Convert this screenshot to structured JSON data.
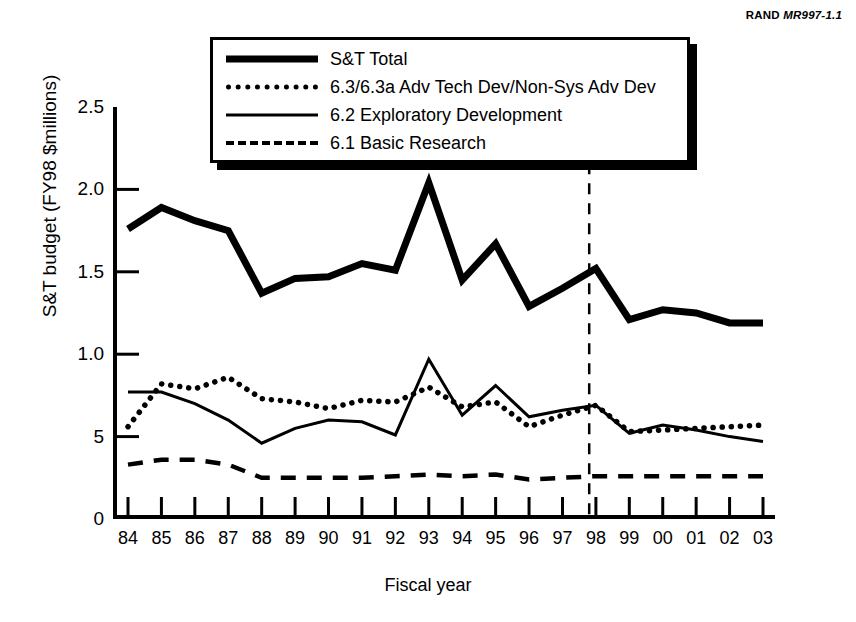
{
  "source": {
    "org": "RAND",
    "doc_id": "MR997-1.1"
  },
  "chart_data": {
    "type": "line",
    "title": "",
    "xlabel": "Fiscal year",
    "ylabel": "S&T budget (FY98 $millions)",
    "x": [
      "84",
      "85",
      "86",
      "87",
      "88",
      "89",
      "90",
      "91",
      "92",
      "93",
      "94",
      "95",
      "96",
      "97",
      "98",
      "99",
      "00",
      "01",
      "02",
      "03"
    ],
    "xlim": [
      0,
      19
    ],
    "ylim": [
      0,
      2.5
    ],
    "yticks": [
      0,
      0.5,
      1.0,
      1.5,
      2.0,
      2.5
    ],
    "ytick_labels": [
      "0",
      "5",
      "1.0",
      "1.5",
      "2.0",
      "2.5"
    ],
    "grid": false,
    "legend_position": "top-center",
    "annotations": [
      {
        "type": "vline",
        "x_index": 13.8,
        "label": "",
        "style": "dashed"
      }
    ],
    "series": [
      {
        "name": "S&T Total",
        "style": "thick-solid",
        "values": [
          1.76,
          1.89,
          1.81,
          1.75,
          1.37,
          1.46,
          1.47,
          1.55,
          1.51,
          2.04,
          1.45,
          1.67,
          1.29,
          1.4,
          1.52,
          1.21,
          1.27,
          1.25,
          1.19,
          1.19
        ]
      },
      {
        "name": "6.3/6.3a Adv Tech Dev/Non-Sys Adv Dev",
        "style": "dotted",
        "values": [
          0.56,
          0.82,
          0.79,
          0.86,
          0.73,
          0.71,
          0.67,
          0.72,
          0.71,
          0.8,
          0.68,
          0.71,
          0.56,
          0.63,
          0.69,
          0.53,
          0.54,
          0.55,
          0.56,
          0.57
        ]
      },
      {
        "name": "6.2 Exploratory Development",
        "style": "thin-solid",
        "values": [
          0.77,
          0.77,
          0.7,
          0.6,
          0.46,
          0.55,
          0.6,
          0.59,
          0.51,
          0.97,
          0.63,
          0.81,
          0.62,
          0.66,
          0.69,
          0.52,
          0.57,
          0.54,
          0.5,
          0.47
        ]
      },
      {
        "name": "6.1 Basic Research",
        "style": "dashed",
        "values": [
          0.33,
          0.36,
          0.36,
          0.33,
          0.25,
          0.25,
          0.25,
          0.25,
          0.26,
          0.27,
          0.26,
          0.27,
          0.24,
          0.25,
          0.26,
          0.26,
          0.26,
          0.26,
          0.26,
          0.26
        ]
      }
    ]
  },
  "legend": {
    "items": [
      {
        "label": "S&T Total",
        "key": "thick-solid"
      },
      {
        "label": "6.3/6.3a Adv Tech Dev/Non-Sys Adv Dev",
        "key": "dotted"
      },
      {
        "label": "6.2 Exploratory Development",
        "key": "thin-solid"
      },
      {
        "label": "6.1 Basic Research",
        "key": "dashed"
      }
    ]
  }
}
